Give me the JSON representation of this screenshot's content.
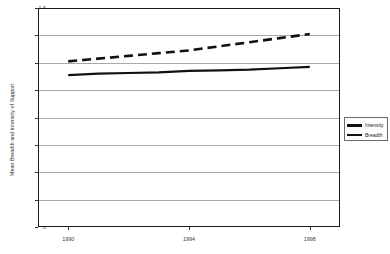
{
  "chart_data": {
    "type": "line",
    "title": "",
    "xlabel": "",
    "ylabel": "Mean Breadth and Intensity of Support",
    "ylim": [
      0,
      1.6
    ],
    "xlim": [
      1989,
      1999
    ],
    "grid": true,
    "legend_position": "right",
    "ytick_labels": [
      "1.6",
      "1.4",
      "1.2",
      "1",
      "0.8",
      "0.6",
      "0.4",
      "0.2",
      "0"
    ],
    "ytick_values": [
      1.6,
      1.4,
      1.2,
      1.0,
      0.8,
      0.6,
      0.4,
      0.2,
      0
    ],
    "xtick_labels": [
      "1990",
      "1994",
      "1998"
    ],
    "xtick_values": [
      1990,
      1994,
      1998
    ],
    "x": [
      1990,
      1991,
      1992,
      1993,
      1994,
      1995,
      1996,
      1997,
      1998
    ],
    "series": [
      {
        "name": "Intensity",
        "style": "dashed",
        "color": "#111111",
        "values": [
          1.21,
          1.23,
          1.25,
          1.27,
          1.29,
          1.32,
          1.35,
          1.38,
          1.41
        ]
      },
      {
        "name": "Breadth",
        "style": "solid",
        "color": "#111111",
        "values": [
          1.11,
          1.12,
          1.125,
          1.13,
          1.14,
          1.145,
          1.15,
          1.16,
          1.17
        ]
      }
    ]
  },
  "legend": {
    "items": [
      {
        "label": "Intensity",
        "style": "dashed"
      },
      {
        "label": "Breadth",
        "style": "solid"
      }
    ]
  },
  "colors": {
    "series": "#111111",
    "gridline": "#a8a8a8",
    "frame": "#1a1a1a",
    "background": "#ffffff",
    "text": "#333333"
  }
}
